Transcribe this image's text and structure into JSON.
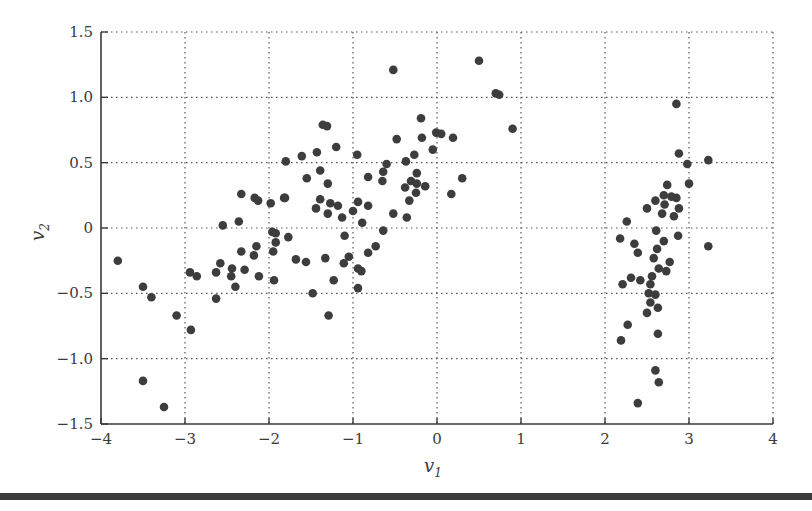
{
  "chart_data": {
    "type": "scatter",
    "title": "",
    "xlabel": "v",
    "xlabel_sub": "1",
    "ylabel": "v",
    "ylabel_sub": "2",
    "xlim": [
      -4,
      4
    ],
    "ylim": [
      -1.5,
      1.5
    ],
    "xticks": [
      -4,
      -3,
      -2,
      -1,
      0,
      1,
      2,
      3,
      4
    ],
    "xtick_labels": [
      "−4",
      "−3",
      "−2",
      "−1",
      "0",
      "1",
      "2",
      "3",
      "4"
    ],
    "yticks": [
      1.5,
      1.0,
      0.5,
      0,
      -0.5,
      -1.0,
      -1.5
    ],
    "ytick_labels": [
      "1.5",
      "1.0",
      "0.5",
      "0",
      "−0.5",
      "−1.0",
      "−1.5"
    ],
    "grid": true,
    "grid_style": "dotted",
    "legend": null,
    "marker_color": "#3d3d3d",
    "series": [
      {
        "name": "points",
        "points": [
          [
            -3.8,
            -0.25
          ],
          [
            -3.5,
            -0.45
          ],
          [
            -3.4,
            -0.53
          ],
          [
            -3.1,
            -0.67
          ],
          [
            -2.93,
            -0.78
          ],
          [
            -3.5,
            -1.17
          ],
          [
            -3.25,
            -1.37
          ],
          [
            -2.94,
            -0.34
          ],
          [
            -2.86,
            -0.37
          ],
          [
            -2.63,
            -0.34
          ],
          [
            -2.63,
            -0.54
          ],
          [
            -2.58,
            -0.27
          ],
          [
            -2.55,
            0.02
          ],
          [
            -2.45,
            -0.37
          ],
          [
            -2.44,
            -0.31
          ],
          [
            -2.4,
            -0.45
          ],
          [
            -2.36,
            0.05
          ],
          [
            -2.33,
            0.26
          ],
          [
            -2.33,
            -0.18
          ],
          [
            -2.29,
            -0.32
          ],
          [
            -2.18,
            -0.21
          ],
          [
            -2.17,
            0.23
          ],
          [
            -2.15,
            -0.14
          ],
          [
            -2.13,
            0.21
          ],
          [
            -2.12,
            -0.37
          ],
          [
            -1.98,
            0.19
          ],
          [
            -1.96,
            -0.03
          ],
          [
            -1.95,
            -0.18
          ],
          [
            -1.94,
            -0.4
          ],
          [
            -1.92,
            -0.04
          ],
          [
            -1.92,
            -0.11
          ],
          [
            -1.82,
            0.23
          ],
          [
            -1.81,
            0.23
          ],
          [
            -1.8,
            0.51
          ],
          [
            -1.77,
            -0.07
          ],
          [
            -1.68,
            -0.24
          ],
          [
            -1.61,
            0.55
          ],
          [
            -1.56,
            -0.26
          ],
          [
            -1.55,
            0.38
          ],
          [
            -1.48,
            -0.5
          ],
          [
            -1.44,
            0.15
          ],
          [
            -1.43,
            0.58
          ],
          [
            -1.39,
            0.44
          ],
          [
            -1.39,
            0.22
          ],
          [
            -1.36,
            0.79
          ],
          [
            -1.33,
            -0.23
          ],
          [
            -1.31,
            0.78
          ],
          [
            -1.3,
            0.34
          ],
          [
            -1.3,
            0.11
          ],
          [
            -1.29,
            -0.67
          ],
          [
            -1.27,
            0.19
          ],
          [
            -1.23,
            -0.4
          ],
          [
            -1.2,
            0.62
          ],
          [
            -1.18,
            0.17
          ],
          [
            -1.13,
            0.08
          ],
          [
            -1.11,
            -0.27
          ],
          [
            -1.1,
            -0.06
          ],
          [
            -1.05,
            -0.22
          ],
          [
            -1.0,
            0.13
          ],
          [
            -0.95,
            0.56
          ],
          [
            -0.94,
            0.2
          ],
          [
            -0.94,
            -0.31
          ],
          [
            -0.94,
            -0.46
          ],
          [
            -0.9,
            -0.33
          ],
          [
            -0.89,
            0.04
          ],
          [
            -0.82,
            0.39
          ],
          [
            -0.82,
            0.17
          ],
          [
            -0.82,
            -0.19
          ],
          [
            -0.73,
            -0.14
          ],
          [
            -0.65,
            0.36
          ],
          [
            -0.64,
            0.43
          ],
          [
            -0.64,
            -0.02
          ],
          [
            -0.6,
            0.49
          ],
          [
            -0.52,
            0.11
          ],
          [
            -0.52,
            1.21
          ],
          [
            -0.48,
            0.68
          ],
          [
            -0.38,
            0.31
          ],
          [
            -0.37,
            0.51
          ],
          [
            -0.36,
            0.08
          ],
          [
            -0.33,
            0.21
          ],
          [
            -0.31,
            0.36
          ],
          [
            -0.27,
            0.56
          ],
          [
            -0.25,
            0.27
          ],
          [
            -0.24,
            0.42
          ],
          [
            -0.24,
            0.34
          ],
          [
            -0.19,
            0.84
          ],
          [
            -0.18,
            0.69
          ],
          [
            -0.14,
            0.32
          ],
          [
            -0.05,
            0.6
          ],
          [
            -0.01,
            0.73
          ],
          [
            0.05,
            0.72
          ],
          [
            0.17,
            0.26
          ],
          [
            0.19,
            0.69
          ],
          [
            0.3,
            0.38
          ],
          [
            0.5,
            1.28
          ],
          [
            0.7,
            1.03
          ],
          [
            0.74,
            1.02
          ],
          [
            0.9,
            0.76
          ],
          [
            2.18,
            -0.08
          ],
          [
            2.19,
            -0.86
          ],
          [
            2.21,
            -0.43
          ],
          [
            2.26,
            0.05
          ],
          [
            2.27,
            -0.74
          ],
          [
            2.31,
            -0.38
          ],
          [
            2.35,
            -0.12
          ],
          [
            2.39,
            -0.19
          ],
          [
            2.39,
            -1.34
          ],
          [
            2.42,
            -0.4
          ],
          [
            2.5,
            0.15
          ],
          [
            2.5,
            -0.65
          ],
          [
            2.52,
            -0.5
          ],
          [
            2.54,
            -0.43
          ],
          [
            2.54,
            -0.57
          ],
          [
            2.56,
            -0.37
          ],
          [
            2.58,
            -0.23
          ],
          [
            2.6,
            0.21
          ],
          [
            2.6,
            -0.51
          ],
          [
            2.6,
            -1.09
          ],
          [
            2.61,
            -0.02
          ],
          [
            2.62,
            -0.16
          ],
          [
            2.63,
            -0.61
          ],
          [
            2.63,
            -0.81
          ],
          [
            2.64,
            -0.31
          ],
          [
            2.64,
            -1.18
          ],
          [
            2.68,
            0.11
          ],
          [
            2.7,
            0.25
          ],
          [
            2.7,
            -0.1
          ],
          [
            2.71,
            0.18
          ],
          [
            2.73,
            -0.33
          ],
          [
            2.74,
            0.33
          ],
          [
            2.77,
            -0.26
          ],
          [
            2.79,
            0.24
          ],
          [
            2.82,
            0.09
          ],
          [
            2.85,
            0.23
          ],
          [
            2.85,
            0.95
          ],
          [
            2.87,
            -0.06
          ],
          [
            2.88,
            0.57
          ],
          [
            2.88,
            0.15
          ],
          [
            2.98,
            0.49
          ],
          [
            3.0,
            0.34
          ],
          [
            3.23,
            0.52
          ],
          [
            3.23,
            -0.14
          ]
        ]
      }
    ]
  },
  "plot": {
    "x_axis_label": "v",
    "x_axis_label_sub": "1",
    "y_axis_label": "v",
    "y_axis_label_sub": "2"
  }
}
